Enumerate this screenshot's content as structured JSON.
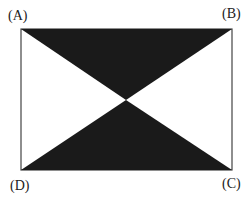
{
  "labels": {
    "a": "(A)",
    "b": "(B)",
    "c": "(C)",
    "d": "(D)"
  },
  "colors": {
    "fill": "#1a1a1a",
    "stroke": "#333333"
  }
}
